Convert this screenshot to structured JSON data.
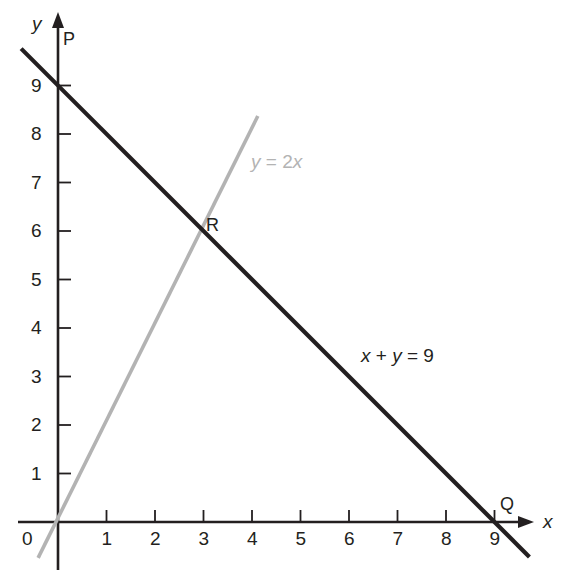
{
  "chart_data": {
    "type": "line",
    "title": "",
    "xlabel": "x",
    "ylabel": "y",
    "xlim": [
      -0.7,
      10.0
    ],
    "ylim": [
      -0.9,
      10.2
    ],
    "grid": false,
    "legend": "inline-labels",
    "xticks": [
      "1",
      "2",
      "3",
      "4",
      "5",
      "6",
      "7",
      "8",
      "9"
    ],
    "xtick_values": [
      1,
      2,
      3,
      4,
      5,
      6,
      7,
      8,
      9
    ],
    "yticks": [
      "1",
      "2",
      "3",
      "4",
      "5",
      "6",
      "7",
      "8",
      "9"
    ],
    "ytick_values": [
      1,
      2,
      3,
      4,
      5,
      6,
      7,
      8,
      9
    ],
    "origin_label": "0",
    "series": [
      {
        "name": "x + y = 9",
        "label": "x + y = 9",
        "color": "#231f20",
        "equation": "x + y = 9",
        "slope": -1,
        "intercept": 9,
        "x": [
          -0.76,
          9.72
        ],
        "y": [
          9.76,
          -0.72
        ],
        "endpoints": [
          [
            -0.76,
            9.76
          ],
          [
            9.72,
            -0.72
          ]
        ]
      },
      {
        "name": "y = 2x",
        "label": "y = 2x",
        "color": "#b3b3b3",
        "equation": "y = 2x",
        "slope": 2,
        "intercept": 0,
        "x": [
          -0.41,
          4.12
        ],
        "y": [
          -0.74,
          8.37
        ],
        "endpoints": [
          [
            -0.41,
            -0.74
          ],
          [
            4.12,
            8.37
          ]
        ]
      }
    ],
    "points": [
      {
        "name": "P",
        "label": "P",
        "x": 0,
        "y": 9,
        "description": "y-intercept of x + y = 9"
      },
      {
        "name": "Q",
        "label": "Q",
        "x": 9,
        "y": 0,
        "description": "x-intercept of x + y = 9"
      },
      {
        "name": "R",
        "label": "R",
        "x": 3,
        "y": 6,
        "description": "intersection of y = 2x and x + y = 9"
      }
    ],
    "annotations": [
      {
        "text": "y = 2x",
        "x": 4.1,
        "y": 6.5,
        "color": "#b3b3b3"
      },
      {
        "text": "x + y = 9",
        "x": 7.2,
        "y": 3.4,
        "color": "#231f20"
      },
      {
        "text": "P",
        "x": 0.15,
        "y": 9.6,
        "color": "#231f20"
      },
      {
        "text": "Q",
        "x": 9.2,
        "y": 0.55,
        "color": "#231f20"
      },
      {
        "text": "R",
        "x": 3.3,
        "y": 6.1,
        "color": "#231f20"
      }
    ]
  },
  "axes": {
    "x_axis_name": "x",
    "y_axis_name": "y",
    "origin_label": "0"
  },
  "labels": {
    "point_p": "P",
    "point_q": "Q",
    "point_r": "R",
    "line_gray_equation_lhs": "y",
    "line_gray_equation_eq": " = 2",
    "line_gray_equation_rhs": "x",
    "line_dark_equation_x": "x",
    "line_dark_equation_plus": " + ",
    "line_dark_equation_y": "y",
    "line_dark_equation_tail": " = 9",
    "line_gray_equation_full": "y = 2x",
    "line_dark_equation_full": "x + y = 9"
  },
  "colors": {
    "line_dark": "#231f20",
    "line_gray": "#b3b3b3",
    "axis": "#231f20",
    "background": "#ffffff",
    "text": "#231f20"
  },
  "geometry": {
    "origin_px": [
      58,
      522
    ],
    "unit_px": 48.5
  }
}
